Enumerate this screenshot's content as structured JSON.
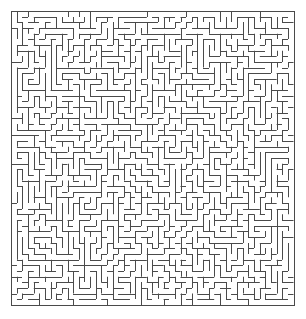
{
  "figure": {
    "kind": "maze-puzzle",
    "width_px": 306,
    "height_px": 319,
    "background_color": "#ffffff"
  },
  "maze": {
    "name": "square-grid-maze",
    "cols": 50,
    "rows": 52,
    "origin_x": 11,
    "origin_y": 11,
    "cell_size": 5.65,
    "wall_color": "#4a4a4a",
    "border_color": "#4a4a4a",
    "wall_thickness": 1,
    "border_thickness": 1,
    "passage_color": "#ffffff",
    "border_closed": true,
    "entrance": "none",
    "exit": "none",
    "seed": 20240517,
    "algorithm": "randomized-depth-first"
  }
}
